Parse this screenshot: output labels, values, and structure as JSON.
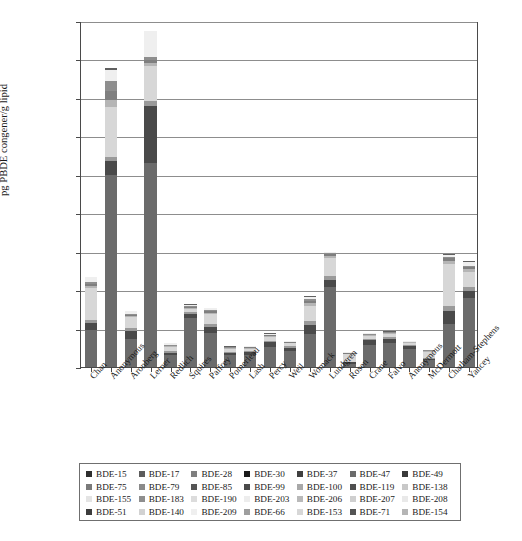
{
  "chart_data": {
    "type": "bar",
    "subtype": "stacked-bar",
    "title": "",
    "xlabel": "",
    "ylabel": "pg PBDE congener/g lipid",
    "ylim": [
      0,
      180000
    ],
    "ytick_values": [
      0,
      20000,
      40000,
      60000,
      80000,
      100000,
      120000,
      140000,
      160000,
      180000
    ],
    "ytick_labels": [
      "0",
      "20,000",
      "40,000",
      "60,000",
      "80,000",
      "100,000",
      "120,000",
      "140,000",
      "160,000",
      "180,000"
    ],
    "grid": true,
    "legend_position": "bottom",
    "categories": [
      "Chan",
      "Anonymous",
      "Aronberg",
      "Lerner",
      "Redlich",
      "Squires",
      "Palfrey",
      "Pomerleau",
      "Lash",
      "Percy",
      "Weil",
      "Womack",
      "Lundgren",
      "Rosen",
      "Crane",
      "Falvo",
      "Anonymous",
      "McDermott",
      "Chatham-Stephens",
      "Yancey"
    ],
    "series": [
      {
        "name": "BDE-47",
        "color": "#6b6b6b",
        "values": [
          19000,
          100000,
          14500,
          106000,
          6400,
          25500,
          17500,
          6400,
          6500,
          10500,
          8200,
          17000,
          41500,
          1800,
          11500,
          12700,
          9300,
          3600,
          22500,
          36000
        ]
      },
      {
        "name": "BDE-99",
        "color": "#4a4a4a",
        "values": [
          3800,
          7000,
          4200,
          30000,
          1100,
          2000,
          3500,
          900,
          1200,
          2300,
          1800,
          5000,
          4000,
          600,
          2400,
          1900,
          1500,
          700,
          6500,
          3500
        ]
      },
      {
        "name": "BDE-100",
        "color": "#9a9a9a",
        "values": [
          1600,
          2500,
          1600,
          2500,
          600,
          900,
          1600,
          400,
          500,
          900,
          700,
          2000,
          2000,
          300,
          900,
          800,
          700,
          300,
          3000,
          2000
        ]
      },
      {
        "name": "BDE-153",
        "color": "#d7d7d7",
        "values": [
          16500,
          26000,
          5500,
          18000,
          2200,
          1800,
          4800,
          1700,
          1400,
          1900,
          1600,
          8000,
          9000,
          4000,
          1400,
          1800,
          1000,
          3400,
          21500,
          8000
        ]
      },
      {
        "name": "BDE-154",
        "color": "#b5b5b5",
        "values": [
          1400,
          3500,
          800,
          1600,
          400,
          600,
          900,
          300,
          300,
          500,
          400,
          1400,
          1200,
          300,
          400,
          400,
          300,
          300,
          1800,
          1400
        ]
      },
      {
        "name": "BDE-28",
        "color": "#7f7f7f",
        "values": [
          1100,
          4500,
          700,
          1800,
          400,
          500,
          800,
          300,
          300,
          400,
          300,
          1200,
          900,
          200,
          300,
          300,
          200,
          200,
          1300,
          1100
        ]
      },
      {
        "name": "BDE-183",
        "color": "#8e8e8e",
        "values": [
          900,
          5500,
          500,
          1300,
          300,
          400,
          600,
          200,
          200,
          300,
          200,
          900,
          700,
          200,
          200,
          200,
          200,
          200,
          900,
          800
        ]
      },
      {
        "name": "BDE-209",
        "color": "#efefef",
        "values": [
          2400,
          5500,
          1300,
          13500,
          900,
          700,
          1000,
          500,
          400,
          600,
          500,
          1200,
          600,
          500,
          400,
          400,
          300,
          300,
          900,
          2000
        ]
      },
      {
        "name": "BDE-17",
        "color": "#606060",
        "values": [
          300,
          1000,
          200,
          400,
          100,
          200,
          200,
          100,
          100,
          100,
          100,
          300,
          200,
          100,
          100,
          100,
          100,
          100,
          300,
          300
        ]
      }
    ]
  },
  "axis": {
    "y_label": "pg PBDE congener/g lipid",
    "y_ticks": [
      "180,000",
      "160,000",
      "140,000",
      "120,000",
      "100,000",
      "80,000",
      "60,000",
      "40,000",
      "20,000",
      "0"
    ]
  },
  "x_labels": [
    "Chan",
    "Anonymous",
    "Aronberg",
    "Lerner",
    "Redlich",
    "Squires",
    "Palfrey",
    "Pomerleau",
    "Lash",
    "Percy",
    "Weil",
    "Womack",
    "Lundgren",
    "Rosen",
    "Crane",
    "Falvo",
    "Anonymous",
    "McDermott",
    "Chatham-Stephens",
    "Yancey"
  ],
  "legend": {
    "items": [
      {
        "label": "BDE-15",
        "color": "#2e2e2e"
      },
      {
        "label": "BDE-17",
        "color": "#5c5c5c"
      },
      {
        "label": "BDE-28",
        "color": "#7f7f7f"
      },
      {
        "label": "BDE-30",
        "color": "#1a1a1a"
      },
      {
        "label": "BDE-37",
        "color": "#3f3f3f"
      },
      {
        "label": "BDE-47",
        "color": "#6b6b6b"
      },
      {
        "label": "BDE-49",
        "color": "#3a3a3a"
      },
      {
        "label": "BDE-75",
        "color": "#7a7a7a"
      },
      {
        "label": "BDE-79",
        "color": "#8a8a8a"
      },
      {
        "label": "BDE-85",
        "color": "#555555"
      },
      {
        "label": "BDE-99",
        "color": "#4a4a4a"
      },
      {
        "label": "BDE-100",
        "color": "#a8a8a8"
      },
      {
        "label": "BDE-119",
        "color": "#4f4f4f"
      },
      {
        "label": "BDE-138",
        "color": "#c8c8c8"
      },
      {
        "label": "BDE-155",
        "color": "#e4e4e4"
      },
      {
        "label": "BDE-183",
        "color": "#8e8e8e"
      },
      {
        "label": "BDE-190",
        "color": "#dcdcdc"
      },
      {
        "label": "BDE-203",
        "color": "#ededed"
      },
      {
        "label": "BDE-206",
        "color": "#b9b9b9"
      },
      {
        "label": "BDE-207",
        "color": "#cfcfcf"
      },
      {
        "label": "BDE-208",
        "color": "#e9e9e9"
      },
      {
        "label": "BDE-51",
        "color": "#3c3c3c"
      },
      {
        "label": "BDE-140",
        "color": "#d2d2d2"
      },
      {
        "label": "BDE-209",
        "color": "#efefef"
      },
      {
        "label": "BDE-66",
        "color": "#9e9e9e"
      },
      {
        "label": "BDE-153",
        "color": "#d7d7d7"
      },
      {
        "label": "BDE-71",
        "color": "#545454"
      },
      {
        "label": "BDE-154",
        "color": "#b5b5b5"
      }
    ]
  }
}
